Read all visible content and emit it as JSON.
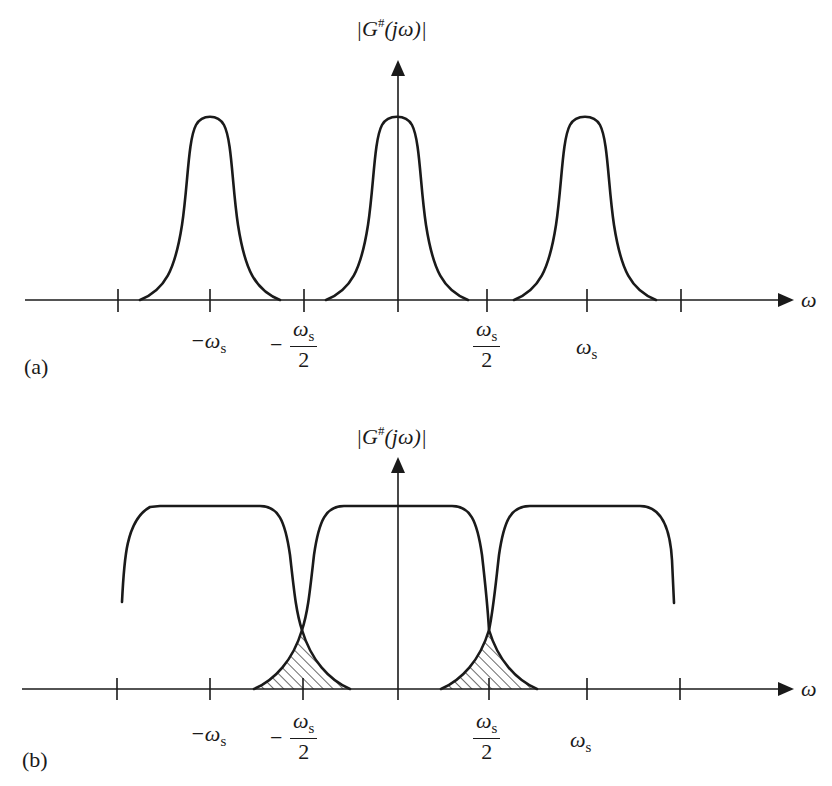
{
  "figure": {
    "panels": [
      {
        "id": "a",
        "panel_label": "(a)",
        "y_axis_label": {
          "pre": "|G",
          "sup": "#",
          "post": "(jω)|"
        },
        "x_axis_label": "ω",
        "ticks": {
          "neg_ws": {
            "sym": "−ω",
            "sub": "s"
          },
          "neg_half_ws": {
            "sign": "−",
            "num_sym": "ω",
            "num_sub": "s",
            "den": "2"
          },
          "half_ws": {
            "num_sym": "ω",
            "num_sub": "s",
            "den": "2"
          },
          "ws": {
            "sym": "ω",
            "sub": "s"
          }
        },
        "description": "Narrow bell-shaped spectra centered at −ωs, 0, ωs; no overlap"
      },
      {
        "id": "b",
        "panel_label": "(b)",
        "y_axis_label": {
          "pre": "|G",
          "sup": "#",
          "post": "(jω)|"
        },
        "x_axis_label": "ω",
        "ticks": {
          "neg_ws": {
            "sym": "−ω",
            "sub": "s"
          },
          "neg_half_ws": {
            "sign": "−",
            "num_sym": "ω",
            "num_sub": "s",
            "den": "2"
          },
          "half_ws": {
            "num_sym": "ω",
            "num_sub": "s",
            "den": "2"
          },
          "ws": {
            "sym": "ω",
            "sub": "s"
          }
        },
        "description": "Wide flat-top spectra overlapping near ±ωs/2; overlap (aliasing) region hatched"
      }
    ],
    "colors": {
      "ink": "#1a1a1a",
      "background": "#ffffff"
    }
  }
}
